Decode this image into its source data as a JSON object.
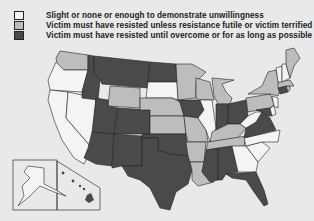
{
  "legend": {
    "items": [
      {
        "key": "slight",
        "label": "Slight or none or enough to demonstrate unwillingness",
        "color": "#f4f4f4"
      },
      {
        "key": "unless_futile",
        "label": "Victim must have resisted unless resistance futile or victim terrified",
        "color": "#bdbdbd"
      },
      {
        "key": "until_overcome",
        "label": "Victim must have resisted until overcome or for as long as possible",
        "color": "#4a4a4a"
      }
    ]
  },
  "colors": {
    "slight": "#f4f4f4",
    "unless_futile": "#bdbdbd",
    "until_overcome": "#4a4a4a",
    "background": "#e9e9e9"
  },
  "states": {
    "WA": "unless_futile",
    "OR": "slight",
    "CA": "slight",
    "NV": "slight",
    "ID": "until_overcome",
    "MT": "until_overcome",
    "WY": "unless_futile",
    "UT": "until_overcome",
    "CO": "until_overcome",
    "AZ": "until_overcome",
    "NM": "until_overcome",
    "ND": "until_overcome",
    "SD": "slight",
    "NE": "unless_futile",
    "KS": "unless_futile",
    "OK": "until_overcome",
    "TX": "until_overcome",
    "MN": "unless_futile",
    "IA": "until_overcome",
    "MO": "unless_futile",
    "AR": "unless_futile",
    "LA": "unless_futile",
    "WI": "unless_futile",
    "IL": "slight",
    "MI": "unless_futile",
    "IN": "until_overcome",
    "OH": "until_overcome",
    "KY": "unless_futile",
    "TN": "unless_futile",
    "MS": "until_overcome",
    "AL": "until_overcome",
    "GA": "slight",
    "FL": "until_overcome",
    "SC": "slight",
    "NC": "slight",
    "VA": "until_overcome",
    "WV": "slight",
    "MD": "until_overcome",
    "DE": "slight",
    "PA": "unless_futile",
    "NJ": "slight",
    "NY": "unless_futile",
    "CT": "until_overcome",
    "RI": "unless_futile",
    "MA": "unless_futile",
    "VT": "slight",
    "NH": "slight",
    "ME": "unless_futile",
    "AK": "slight",
    "HI": "until_overcome"
  }
}
